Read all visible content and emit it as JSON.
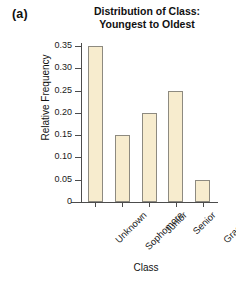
{
  "panel": {
    "label": "(a)"
  },
  "chart_data": {
    "type": "bar",
    "title": "Distribution of Class: Youngest to Oldest",
    "title_lines": [
      "Distribution of Class:",
      "Youngest to Oldest"
    ],
    "xlabel": "Class",
    "ylabel": "Relative Frequency",
    "categories": [
      "Unknown",
      "Sophomore",
      "Junior",
      "Senior",
      "Graduate"
    ],
    "values": [
      0.35,
      0.15,
      0.2,
      0.25,
      0.05
    ],
    "ylim": [
      0,
      0.36
    ],
    "yticks": [
      0,
      0.05,
      0.1,
      0.15,
      0.2,
      0.25,
      0.3,
      0.35
    ],
    "ytick_labels": [
      "0",
      "0.05",
      "0.10",
      "0.15",
      "0.20",
      "0.25",
      "0.30",
      "0.35"
    ],
    "grid": false,
    "legend": false,
    "bar_fill_color": "#f7ecce",
    "bar_edge_color": "#8d8a80",
    "axis_color": "#4c4c4c",
    "background_color": "#ffffff"
  }
}
